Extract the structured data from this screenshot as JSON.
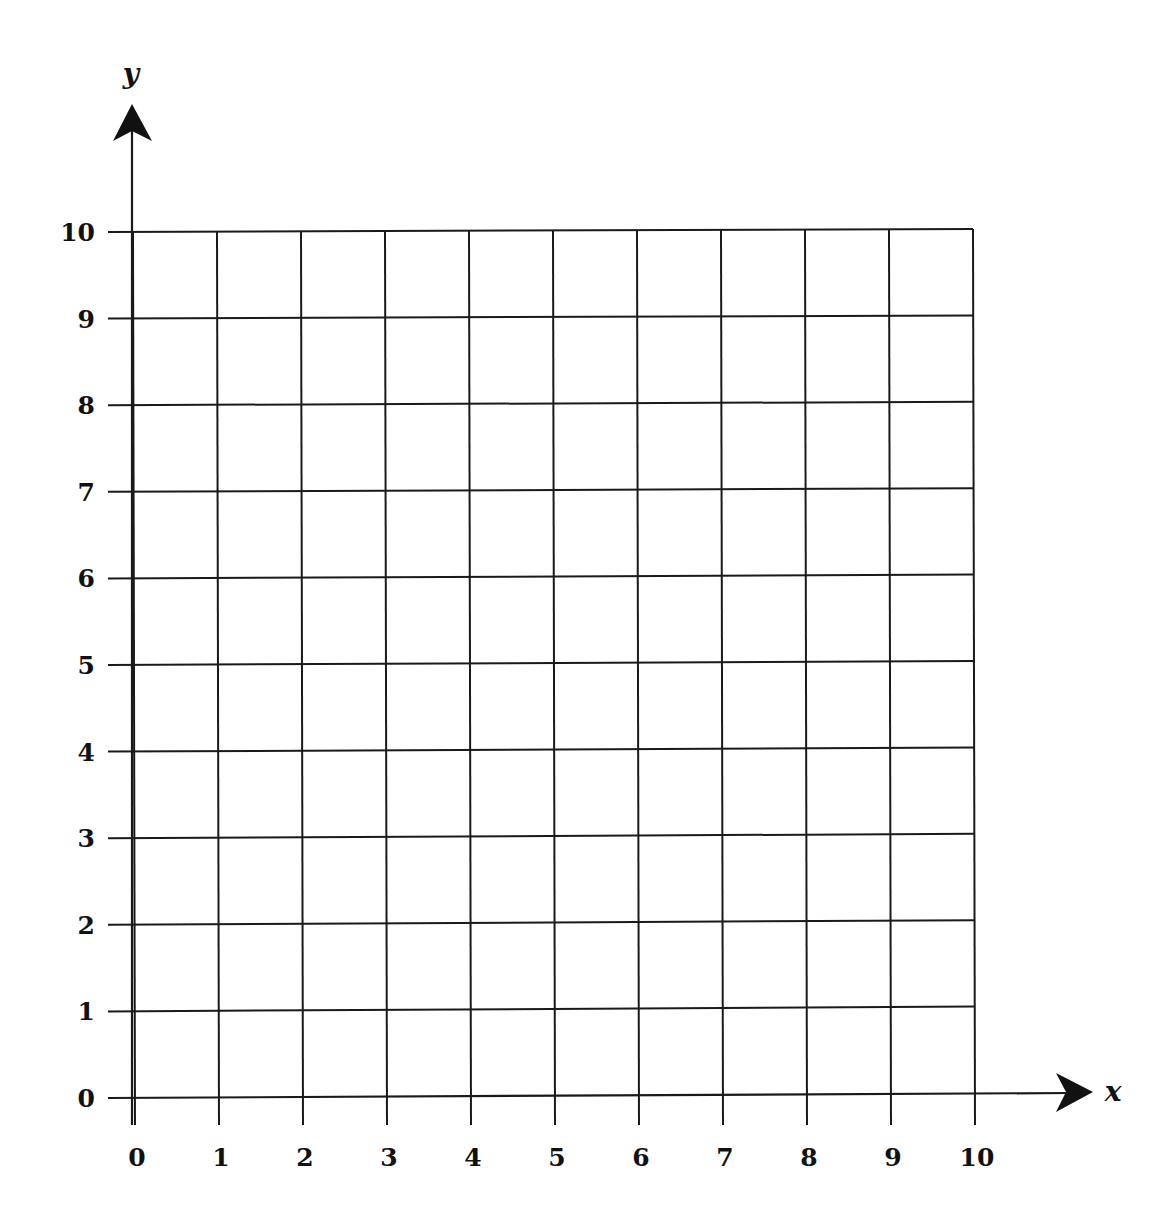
{
  "chart_data": {
    "type": "scatter",
    "title": "",
    "xlabel": "x",
    "ylabel": "y",
    "xlim": [
      0,
      10
    ],
    "ylim": [
      0,
      10
    ],
    "grid": true,
    "legend": null,
    "x_ticks": [
      "0",
      "1",
      "2",
      "3",
      "4",
      "5",
      "6",
      "7",
      "8",
      "9",
      "10"
    ],
    "y_ticks": [
      "0",
      "1",
      "2",
      "3",
      "4",
      "5",
      "6",
      "7",
      "8",
      "9",
      "10"
    ],
    "series": []
  },
  "colors": {
    "line": "#1a1a1a",
    "background": "#ffffff"
  },
  "axes": {
    "x_name": "x",
    "y_name": "y"
  }
}
